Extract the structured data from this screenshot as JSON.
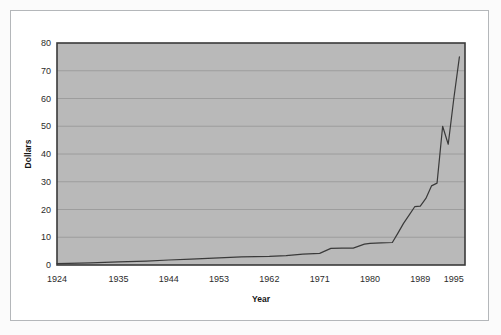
{
  "figure": {
    "background_color": "#fbfbfb",
    "frame_color": "#b4b7ba"
  },
  "chart_data": {
    "type": "line",
    "title": "",
    "xlabel": "Year",
    "ylabel": "Dollars",
    "xlim": [
      1924,
      1997
    ],
    "ylim": [
      0,
      80
    ],
    "grid": true,
    "grid_axis": "y",
    "legend": false,
    "legend_position": "none",
    "plot_background_color": "#b9b9b9",
    "line_color": "#3a3a3a",
    "axis_color": "#3a3a3a",
    "gridline_color": "#9a9a9a",
    "xticks": [
      1924,
      1935,
      1944,
      1953,
      1962,
      1971,
      1980,
      1989,
      1995
    ],
    "xtick_labels": [
      "1924",
      "1935",
      "1944",
      "1953",
      "1962",
      "1971",
      "1980",
      "1989",
      "1995"
    ],
    "yticks": [
      0,
      10,
      20,
      30,
      40,
      50,
      60,
      70,
      80
    ],
    "ytick_labels": [
      "0",
      "10",
      "20",
      "30",
      "40",
      "50",
      "60",
      "70",
      "80"
    ],
    "series": [
      {
        "name": "Dollars",
        "x": [
          1924,
          1930,
          1935,
          1940,
          1944,
          1948,
          1953,
          1957,
          1962,
          1965,
          1968,
          1971,
          1973,
          1975,
          1977,
          1979,
          1980,
          1982,
          1984,
          1985,
          1986,
          1987,
          1988,
          1989,
          1990,
          1991,
          1992,
          1993,
          1994,
          1995,
          1996
        ],
        "y": [
          0.5,
          0.8,
          1.1,
          1.4,
          1.8,
          2.1,
          2.6,
          2.9,
          3.1,
          3.4,
          3.9,
          4.2,
          6.0,
          6.1,
          6.1,
          7.5,
          7.8,
          8.0,
          8.1,
          11.5,
          15.0,
          18.0,
          21.0,
          21.2,
          24.0,
          28.5,
          29.5,
          50.0,
          43.5,
          60.0,
          75.0
        ]
      }
    ]
  }
}
